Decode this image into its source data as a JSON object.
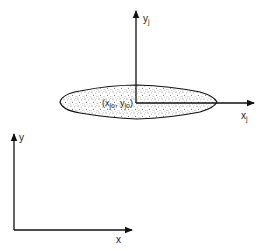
{
  "diagram": {
    "type": "coordinate-systems",
    "colors": {
      "line": "#111111",
      "fill_speckle": "#555555",
      "background": "#ffffff"
    },
    "local_frame": {
      "x_axis_label": "x",
      "x_axis_subscript": "j",
      "y_axis_label": "y",
      "y_axis_subscript": "j",
      "origin_label_open": "(x",
      "origin_label_sub1": "jo",
      "origin_label_mid": ", y",
      "origin_label_sub2": "jo",
      "origin_label_close": ")"
    },
    "global_frame": {
      "x_axis_label": "x",
      "y_axis_label": "y"
    },
    "shape": {
      "description": "speckled lens/ellipse body"
    }
  }
}
